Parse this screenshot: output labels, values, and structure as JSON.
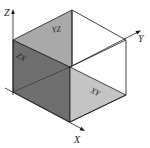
{
  "diagram": {
    "title": "",
    "axes": {
      "x_label": "X",
      "y_label": "Y",
      "z_label": "Z"
    },
    "planes": [
      {
        "name": "YZ",
        "label": "YZ",
        "fill": "#a9a9a9"
      },
      {
        "name": "ZX",
        "label": "ZX",
        "fill": "#6f6f6f"
      },
      {
        "name": "XY",
        "label": "XY",
        "fill": "#c4c4c4"
      }
    ],
    "colors": {
      "line": "#1a1a1a",
      "background": "#ffffff"
    }
  }
}
